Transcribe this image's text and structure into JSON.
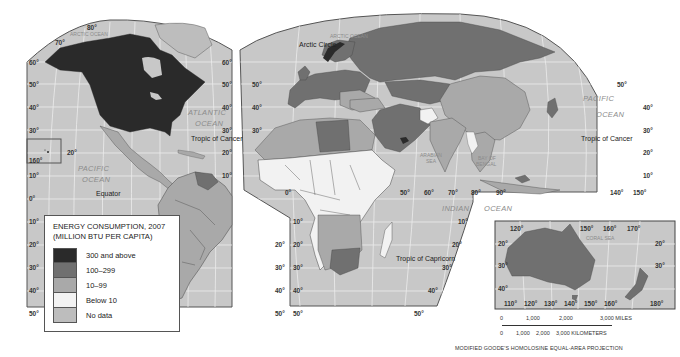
{
  "map": {
    "projection": "MODIFIED GOODE'S HOMOLOSINE EQUAL-AREA PROJECTION",
    "colors": {
      "sea": "#c8c8c8",
      "c300": "#2a2a2a",
      "c100": "#707070",
      "c10": "#a9a9a9",
      "below10": "#f2f2f2",
      "nodata": "#bdbdbd",
      "border": "#444444",
      "grid": "#ececec"
    }
  },
  "legend": {
    "title_line1": "ENERGY CONSUMPTION, 2007",
    "title_line2": "(MILLION BTU PER CAPITA)",
    "items": [
      {
        "label": "300 and above",
        "color": "#2a2a2a"
      },
      {
        "label": "100–299",
        "color": "#707070"
      },
      {
        "label": "10–99",
        "color": "#a9a9a9"
      },
      {
        "label": "Below 10",
        "color": "#f2f2f2"
      },
      {
        "label": "No data",
        "color": "#bdbdbd"
      }
    ]
  },
  "labels": {
    "arctic_ocean_1": "ARCTIC OCEAN",
    "arctic_ocean_2": "ARCTIC OCEAN",
    "arctic_circle": "Arctic Circle",
    "atlantic_1": "ATLANTIC",
    "atlantic_2": "OCEAN",
    "pacific_w_1": "PACIFIC",
    "pacific_w_2": "OCEAN",
    "pacific_e_1": "PACIFIC",
    "pacific_e_2": "OCEAN",
    "indian_1": "INDIAN",
    "indian_2": "OCEAN",
    "arabian_sea_1": "ARABIAN",
    "arabian_sea_2": "SEA",
    "bay_of_bengal_1": "BAY OF",
    "bay_of_bengal_2": "BENGAL",
    "coral_sea": "CORAL SEA",
    "tropic_cancer_w": "Tropic of Cancer",
    "tropic_cancer_e": "Tropic of Cancer",
    "tropic_capricorn": "Tropic of Capricorn",
    "equator": "Equator"
  },
  "degrees": {
    "left_lat": [
      "60°",
      "50°",
      "40°",
      "30°",
      "160°",
      "10°",
      "0°",
      "10°",
      "20°",
      "30°",
      "40°",
      "50°"
    ],
    "top_80": "80°",
    "top_70": "70°",
    "hawaii_20": "20°",
    "mid_lat_a": [
      "60°",
      "50°",
      "40°",
      "30°",
      "20°",
      "10°"
    ],
    "mid_lat_b": [
      "50°",
      "40°",
      "30°"
    ],
    "sa_right": [
      "20°",
      "30°",
      "40°",
      "50°"
    ],
    "af_left": [
      "10°",
      "20°",
      "30°",
      "40°",
      "50°"
    ],
    "zero_lon": "0°",
    "indian_lon": [
      "50°",
      "60°",
      "70°",
      "80°",
      "90°"
    ],
    "indian_lat": [
      "10°",
      "20°",
      "30°",
      "40°",
      "50°"
    ],
    "east_lat": [
      "50°",
      "40°",
      "30°",
      "20°",
      "10°"
    ],
    "east_lon": [
      "140°",
      "150°"
    ],
    "aus_top": [
      "120°",
      "150°",
      "160°",
      "170°"
    ],
    "aus_lat_left": [
      "20°",
      "30°",
      "40°"
    ],
    "aus_lat_right": [
      "20°",
      "30°"
    ],
    "aus_bottom": [
      "110°",
      "120°",
      "130°",
      "140°",
      "150°",
      "160°",
      "180°"
    ]
  },
  "scale": {
    "miles": [
      "0",
      "1,000",
      "2,000",
      "3,000 MILES"
    ],
    "km": [
      "0",
      "1,000",
      "2,000",
      "3,000 KILOMETERS"
    ]
  }
}
